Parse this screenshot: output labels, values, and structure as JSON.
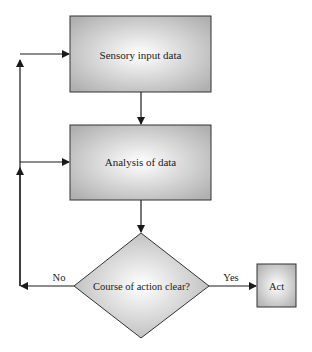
{
  "diagram": {
    "type": "flowchart",
    "nodes": [
      {
        "id": "sensory",
        "shape": "rectangle",
        "label": "Sensory input data"
      },
      {
        "id": "analysis",
        "shape": "rectangle",
        "label": "Analysis of data"
      },
      {
        "id": "decision",
        "shape": "diamond",
        "label": "Course of action clear?"
      },
      {
        "id": "act",
        "shape": "rectangle",
        "label": "Act"
      }
    ],
    "edges": [
      {
        "from": "sensory",
        "to": "analysis",
        "label": ""
      },
      {
        "from": "analysis",
        "to": "decision",
        "label": ""
      },
      {
        "from": "decision",
        "to": "act",
        "label": "Yes"
      },
      {
        "from": "decision",
        "to": "analysis",
        "label": "No"
      },
      {
        "from": "decision",
        "to": "sensory",
        "label": "No"
      }
    ],
    "labels": {
      "no": "No",
      "yes": "Yes"
    },
    "colors": {
      "fill_center": "#ffffff",
      "fill_edge": "#b4b4b4",
      "stroke": "#333333",
      "line": "#1a1a1a"
    }
  }
}
